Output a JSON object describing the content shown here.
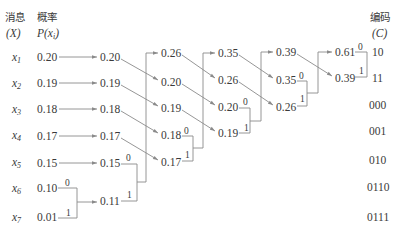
{
  "headers": {
    "message": "消息",
    "message_var": "(X)",
    "prob": "概率",
    "prob_var_prefix": "P(x",
    "prob_var_sub": "i",
    "prob_var_suffix": ")",
    "code": "编码",
    "code_var": "(C)"
  },
  "symbols": [
    {
      "base": "x",
      "sub": "1"
    },
    {
      "base": "x",
      "sub": "2"
    },
    {
      "base": "x",
      "sub": "3"
    },
    {
      "base": "x",
      "sub": "4"
    },
    {
      "base": "x",
      "sub": "5"
    },
    {
      "base": "x",
      "sub": "6"
    },
    {
      "base": "x",
      "sub": "7"
    }
  ],
  "columns": [
    [
      "0.20",
      "0.19",
      "0.18",
      "0.17",
      "0.15",
      "0.10",
      "0.01"
    ],
    [
      "0.20",
      "0.19",
      "0.18",
      "0.17",
      "0.15",
      "0.11"
    ],
    [
      "0.26",
      "0.20",
      "0.19",
      "0.18",
      "0.17"
    ],
    [
      "0.35",
      "0.26",
      "0.20",
      "0.19"
    ],
    [
      "0.39",
      "0.35",
      "0.26"
    ],
    [
      "0.61",
      "0.39"
    ]
  ],
  "branch_labels": {
    "zero": "0",
    "one": "1"
  },
  "codes": [
    "10",
    "11",
    "000",
    "001",
    "010",
    "0110",
    "0111"
  ],
  "colors": {
    "text": "#3a3a3a",
    "line": "#8a8a8a"
  }
}
